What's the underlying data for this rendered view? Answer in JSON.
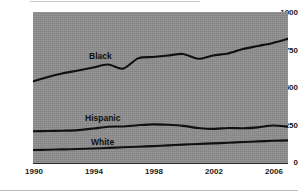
{
  "chart_data": {
    "type": "line",
    "title": "",
    "subtitle": "",
    "xlabel": "",
    "ylabel": "",
    "xlim": [
      1990,
      2007
    ],
    "ylim": [
      0,
      1000
    ],
    "yticks": [
      0,
      250,
      500,
      750,
      1000
    ],
    "xticks": [
      1990,
      1994,
      1998,
      2002,
      2006
    ],
    "grid": false,
    "legend_position": "inline-labels",
    "plot_background": "#8e8e8e",
    "line_color": "#101010",
    "x": [
      1990,
      1991,
      1992,
      1993,
      1994,
      1995,
      1996,
      1997,
      1998,
      1999,
      2000,
      2001,
      2002,
      2003,
      2004,
      2005,
      2006,
      2007
    ],
    "series": [
      {
        "name": "Black",
        "label": "Black",
        "values": [
          540,
          570,
          595,
          612,
          632,
          652,
          625,
          693,
          702,
          712,
          722,
          690,
          712,
          725,
          755,
          775,
          795,
          822
        ]
      },
      {
        "name": "Hispanic",
        "label": "Hispanic",
        "values": [
          210,
          212,
          214,
          218,
          228,
          240,
          242,
          250,
          256,
          253,
          246,
          232,
          226,
          232,
          230,
          236,
          248,
          241
        ]
      },
      {
        "name": "White",
        "label": "White",
        "values": [
          86,
          88,
          90,
          93,
          96,
          100,
          104,
          108,
          112,
          117,
          122,
          126,
          130,
          134,
          139,
          143,
          147,
          150
        ]
      }
    ],
    "annotations": [
      {
        "text": "Black",
        "x": 1994.3,
        "y": 700
      },
      {
        "text": "Hispanic",
        "x": 1994.1,
        "y": 330
      },
      {
        "text": "White",
        "x": 1994.4,
        "y": 170
      }
    ]
  },
  "axis": {
    "y_labels": [
      "1000",
      "750",
      "500",
      "250",
      "0"
    ],
    "x_labels": [
      "1990",
      "1994",
      "1998",
      "2002",
      "2006"
    ]
  },
  "labels": {
    "black": "Black",
    "hispanic": "Hispanic",
    "white": "White"
  }
}
